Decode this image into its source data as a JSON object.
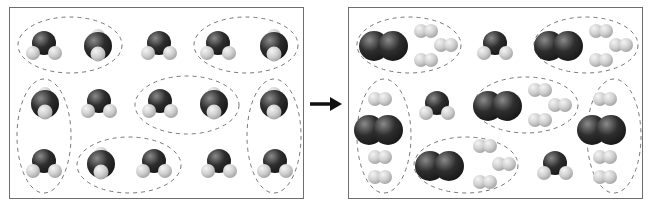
{
  "figure": {
    "colors": {
      "oxygen_atom": "#2e2e2e",
      "hydrogen_atom": "#cfcfcf",
      "frame_border": "#6e6e6e",
      "dashed_group": "#777777",
      "arrow": "#111111"
    },
    "left_panel": {
      "label": "reactants",
      "molecule_type": "H2O",
      "molecule_count": 15,
      "molecules": [
        {
          "x": 34,
          "y": 38,
          "tilt": false
        },
        {
          "x": 88,
          "y": 38,
          "tilt": true
        },
        {
          "x": 149,
          "y": 38,
          "tilt": false
        },
        {
          "x": 208,
          "y": 38,
          "tilt": false
        },
        {
          "x": 264,
          "y": 38,
          "tilt": true
        },
        {
          "x": 35,
          "y": 96,
          "tilt": true
        },
        {
          "x": 89,
          "y": 96,
          "tilt": false
        },
        {
          "x": 150,
          "y": 96,
          "tilt": false
        },
        {
          "x": 204,
          "y": 96,
          "tilt": true
        },
        {
          "x": 264,
          "y": 96,
          "tilt": true
        },
        {
          "x": 34,
          "y": 156,
          "tilt": false
        },
        {
          "x": 91,
          "y": 156,
          "tilt": true
        },
        {
          "x": 144,
          "y": 156,
          "tilt": false
        },
        {
          "x": 209,
          "y": 156,
          "tilt": false
        },
        {
          "x": 265,
          "y": 156,
          "tilt": false
        }
      ],
      "groups": [
        {
          "cx": 60,
          "cy": 37,
          "rx": 52,
          "ry": 28
        },
        {
          "cx": 236,
          "cy": 37,
          "rx": 52,
          "ry": 28
        },
        {
          "cx": 177,
          "cy": 97,
          "rx": 52,
          "ry": 29
        },
        {
          "cx": 34,
          "cy": 128,
          "rx": 27,
          "ry": 57
        },
        {
          "cx": 264,
          "cy": 128,
          "rx": 27,
          "ry": 57
        },
        {
          "cx": 119,
          "cy": 157,
          "rx": 52,
          "ry": 28
        }
      ]
    },
    "right_panel": {
      "label": "products",
      "o2": [
        {
          "x": 32,
          "y": 38
        },
        {
          "x": 207,
          "y": 38
        },
        {
          "x": 146,
          "y": 98
        },
        {
          "x": 27,
          "y": 122
        },
        {
          "x": 250,
          "y": 122
        },
        {
          "x": 88,
          "y": 158
        }
      ],
      "h2": [
        {
          "x": 77,
          "y": 23
        },
        {
          "x": 97,
          "y": 37
        },
        {
          "x": 77,
          "y": 52
        },
        {
          "x": 252,
          "y": 23
        },
        {
          "x": 272,
          "y": 37
        },
        {
          "x": 252,
          "y": 52
        },
        {
          "x": 191,
          "y": 82
        },
        {
          "x": 211,
          "y": 97
        },
        {
          "x": 191,
          "y": 112
        },
        {
          "x": 31,
          "y": 91
        },
        {
          "x": 31,
          "y": 149
        },
        {
          "x": 31,
          "y": 169
        },
        {
          "x": 256,
          "y": 91
        },
        {
          "x": 256,
          "y": 149
        },
        {
          "x": 256,
          "y": 169
        },
        {
          "x": 136,
          "y": 138
        },
        {
          "x": 155,
          "y": 156
        },
        {
          "x": 136,
          "y": 174
        }
      ],
      "h2o_leftover": [
        {
          "x": 146,
          "y": 38
        },
        {
          "x": 88,
          "y": 98
        },
        {
          "x": 206,
          "y": 158
        }
      ],
      "groups": [
        {
          "cx": 60,
          "cy": 37,
          "rx": 52,
          "ry": 28
        },
        {
          "cx": 237,
          "cy": 37,
          "rx": 52,
          "ry": 28
        },
        {
          "cx": 177,
          "cy": 97,
          "rx": 52,
          "ry": 28
        },
        {
          "cx": 35,
          "cy": 128,
          "rx": 27,
          "ry": 57
        },
        {
          "cx": 265,
          "cy": 128,
          "rx": 27,
          "ry": 57
        },
        {
          "cx": 117,
          "cy": 157,
          "rx": 52,
          "ry": 28
        }
      ]
    },
    "arrow": {
      "direction": "right",
      "meaning": "yields"
    }
  }
}
